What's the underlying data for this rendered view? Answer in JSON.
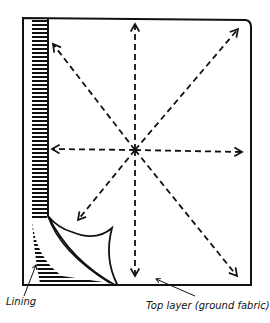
{
  "diagram": {
    "title": "",
    "labels": {
      "lining": "Lining",
      "top_layer": "Top layer (ground fabric)"
    },
    "elements": {
      "frame": "rectangular fabric panel outline",
      "lining_strip": "hatched lining strip along left edge",
      "folded_corner": "lifted corner of top layer revealing lining",
      "arrows": [
        "up",
        "down",
        "left",
        "right",
        "up-left",
        "up-right",
        "down-left",
        "down-right"
      ]
    },
    "colors": {
      "ink": "#111111",
      "background": "#ffffff"
    }
  }
}
